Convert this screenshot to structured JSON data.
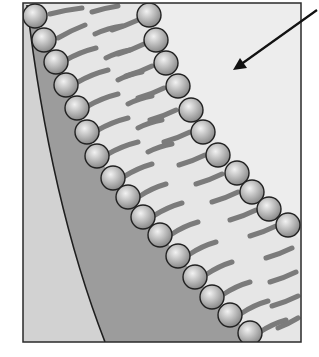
{
  "figure": {
    "title": "",
    "labels": [],
    "colors": {
      "background": "#ffffff",
      "frame": "#2a2a2a",
      "outer_region": "#ebebeb",
      "tail_region": "#e4e4e4",
      "inner_dark_region": "#9a9a9a",
      "left_light_region": "#d0d0d0",
      "tails": "#7a7a7a",
      "head_fill": "#b8b8b8",
      "head_stroke": "#222222",
      "arrow": "#111111"
    },
    "frame": {
      "x": 23,
      "y": 3,
      "width": 278,
      "height": 339
    },
    "arrow": {
      "from": [
        317,
        10
      ],
      "to": [
        233,
        70
      ]
    }
  }
}
